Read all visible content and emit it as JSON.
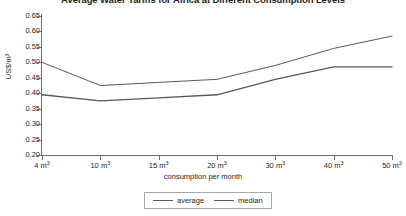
{
  "chart_data": {
    "type": "line",
    "title": "Average Water Tariffs for Africa at Different Consumption Levels",
    "xlabel": "consumption per month",
    "ylabel": "US$/m³",
    "categories": [
      "4 m³",
      "10 m³",
      "15 m³",
      "20 m³",
      "30 m³",
      "40 m³",
      "50 m³"
    ],
    "x_values": [
      4,
      10,
      15,
      20,
      30,
      40,
      50
    ],
    "ylim": [
      0.2,
      0.65
    ],
    "ytick_labels": [
      "0.65",
      "0.60",
      "0.55",
      "0.50",
      "0.45",
      "0.40",
      "0.35",
      "0.30",
      "0.25",
      "0.20"
    ],
    "ytick_values": [
      0.65,
      0.6,
      0.55,
      0.5,
      0.45,
      0.4,
      0.35,
      0.3,
      0.25,
      0.2
    ],
    "grid": false,
    "legend_position": "bottom",
    "series": [
      {
        "name": "average",
        "color": "#58595b",
        "values": [
          0.5,
          0.425,
          0.435,
          0.445,
          0.49,
          0.545,
          0.585
        ]
      },
      {
        "name": "median",
        "color": "#58595b",
        "values": [
          0.395,
          0.375,
          0.385,
          0.395,
          0.445,
          0.485,
          0.485
        ]
      }
    ]
  },
  "legend": {
    "entries": [
      {
        "label": "average"
      },
      {
        "label": "median"
      }
    ]
  }
}
